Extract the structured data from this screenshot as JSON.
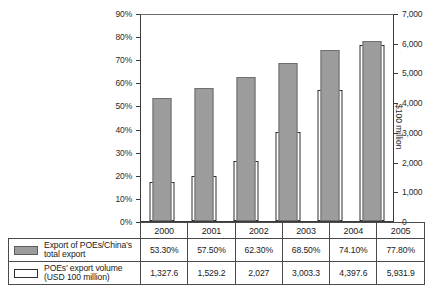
{
  "chart_data": {
    "type": "bar",
    "title": "",
    "xlabel": "",
    "ylabel": "",
    "categories": [
      "2000",
      "2001",
      "2002",
      "2003",
      "2004",
      "2005"
    ],
    "left_axis": {
      "label": "",
      "ticks": [
        "0%",
        "10%",
        "20%",
        "30%",
        "40%",
        "50%",
        "60%",
        "70%",
        "80%",
        "90%"
      ],
      "tick_values": [
        0,
        10,
        20,
        30,
        40,
        50,
        60,
        70,
        80,
        90
      ],
      "min": 0,
      "max": 90,
      "unit": "%"
    },
    "right_axis": {
      "label": "$100 million",
      "ticks": [
        "0",
        "1,000",
        "2,000",
        "3,000",
        "4,000",
        "5,000",
        "6,000",
        "7,000"
      ],
      "tick_values": [
        0,
        1000,
        2000,
        3000,
        4000,
        5000,
        6000,
        7000
      ],
      "min": 0,
      "max": 7000
    },
    "grid": false,
    "legend_position": "table-below",
    "series": [
      {
        "name": "Export of POEs/China's total export",
        "axis": "left",
        "style": "filled-gray",
        "color": "#9c9c9c",
        "values": [
          53.3,
          57.5,
          62.3,
          68.5,
          74.1,
          77.8
        ],
        "display_values": [
          "53.30%",
          "57.50%",
          "62.30%",
          "68.50%",
          "74.10%",
          "77.80%"
        ]
      },
      {
        "name": "POEs' export volume (USD 100 million)",
        "axis": "right",
        "style": "hollow-white",
        "color": "#ffffff",
        "values": [
          1327.6,
          1529.2,
          2027,
          3003.3,
          4397.6,
          5931.9
        ],
        "display_values": [
          "1,327.6",
          "1,529.2",
          "2,027",
          "3,003.3",
          "4,397.6",
          "5,931.9"
        ]
      }
    ]
  },
  "table": {
    "row_labels": [
      "Export of POEs/China’s total export",
      "POEs’ export volume (USD 100 million)"
    ],
    "legend_line1": [
      "Export of POEs/China’s",
      "POEs’ export volume"
    ],
    "legend_line2": [
      "total export",
      "(USD 100 million)"
    ],
    "swatch_names": [
      "filled-gray-swatch",
      "hollow-white-swatch"
    ]
  }
}
